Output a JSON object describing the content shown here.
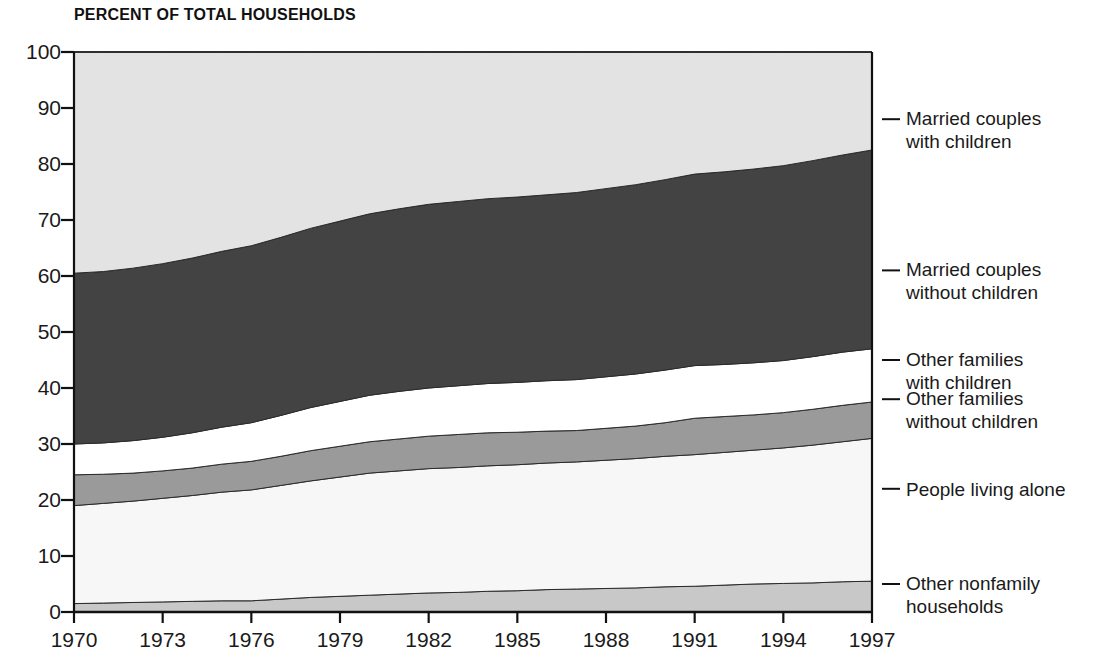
{
  "chart_data": {
    "type": "area",
    "title": "PERCENT OF TOTAL HOUSEHOLDS",
    "xlabel": "",
    "ylabel": "",
    "stacked": true,
    "stack_total": 100,
    "grid": false,
    "legend_position": "right-outside",
    "xlim": [
      1970,
      1997
    ],
    "ylim": [
      0,
      100
    ],
    "ytick_labels": [
      "0",
      "10",
      "20",
      "30",
      "40",
      "50",
      "60",
      "70",
      "80",
      "90",
      "100"
    ],
    "ytick_values": [
      0,
      10,
      20,
      30,
      40,
      50,
      60,
      70,
      80,
      90,
      100
    ],
    "xtick_labels": [
      "1970",
      "1973",
      "1976",
      "1979",
      "1982",
      "1985",
      "1988",
      "1991",
      "1994",
      "1997"
    ],
    "xtick_values": [
      1970,
      1973,
      1976,
      1979,
      1982,
      1985,
      1988,
      1991,
      1994,
      1997
    ],
    "x": [
      1970,
      1971,
      1972,
      1973,
      1974,
      1975,
      1976,
      1977,
      1978,
      1979,
      1980,
      1981,
      1982,
      1983,
      1984,
      1985,
      1986,
      1987,
      1988,
      1989,
      1990,
      1991,
      1992,
      1993,
      1994,
      1995,
      1996,
      1997
    ],
    "series": [
      {
        "name": "Other nonfamily households",
        "color": "#c8c8c8",
        "stack_order": 1,
        "values": [
          1.5,
          1.6,
          1.7,
          1.8,
          1.9,
          2.0,
          2.0,
          2.3,
          2.6,
          2.8,
          3.0,
          3.2,
          3.4,
          3.5,
          3.7,
          3.8,
          4.0,
          4.1,
          4.2,
          4.3,
          4.5,
          4.6,
          4.8,
          5.0,
          5.1,
          5.2,
          5.4,
          5.5
        ]
      },
      {
        "name": "People living alone",
        "color": "#f7f7f7",
        "stack_order": 2,
        "values": [
          17.5,
          17.8,
          18.1,
          18.5,
          18.9,
          19.4,
          19.8,
          20.3,
          20.8,
          21.3,
          21.8,
          22.0,
          22.2,
          22.3,
          22.4,
          22.5,
          22.6,
          22.7,
          22.9,
          23.1,
          23.3,
          23.5,
          23.7,
          23.9,
          24.2,
          24.6,
          25.0,
          25.5
        ]
      },
      {
        "name": "Other families without children",
        "color": "#9a9a9a",
        "stack_order": 3,
        "values": [
          5.5,
          5.2,
          5.0,
          4.9,
          4.9,
          5.0,
          5.1,
          5.2,
          5.4,
          5.5,
          5.6,
          5.7,
          5.8,
          5.9,
          5.9,
          5.8,
          5.7,
          5.6,
          5.7,
          5.8,
          6.0,
          6.5,
          6.4,
          6.3,
          6.3,
          6.4,
          6.5,
          6.5
        ]
      },
      {
        "name": "Other families with children",
        "color": "#ffffff",
        "stack_order": 4,
        "values": [
          5.5,
          5.6,
          5.8,
          6.0,
          6.3,
          6.6,
          6.9,
          7.3,
          7.7,
          8.0,
          8.3,
          8.5,
          8.6,
          8.7,
          8.8,
          8.9,
          9.0,
          9.1,
          9.2,
          9.3,
          9.4,
          9.4,
          9.3,
          9.3,
          9.3,
          9.4,
          9.5,
          9.5
        ]
      },
      {
        "name": "Married couples without children",
        "color": "#434343",
        "stack_order": 5,
        "values": [
          30.5,
          30.6,
          30.8,
          31.0,
          31.2,
          31.4,
          31.6,
          31.8,
          32.0,
          32.2,
          32.4,
          32.6,
          32.8,
          32.9,
          33.0,
          33.1,
          33.2,
          33.4,
          33.6,
          33.8,
          34.0,
          34.2,
          34.4,
          34.6,
          34.8,
          35.0,
          35.2,
          35.5
        ]
      },
      {
        "name": "Married couples with children",
        "color": "#e3e3e3",
        "stack_order": 6,
        "values": [
          39.5,
          39.2,
          38.6,
          37.8,
          36.8,
          35.6,
          34.6,
          33.1,
          31.5,
          30.2,
          28.9,
          28.0,
          27.2,
          26.7,
          26.2,
          25.9,
          25.5,
          25.1,
          24.4,
          23.7,
          22.8,
          21.8,
          21.4,
          20.9,
          20.3,
          19.4,
          18.4,
          17.5
        ]
      }
    ],
    "boundaries_note": "cumulative stacked tops, bottom-up",
    "legend_entries": [
      {
        "label": "Married couples\nwith children",
        "anchor_percent": 88
      },
      {
        "label": "Married couples\nwithout children",
        "anchor_percent": 61
      },
      {
        "label": "Other families\nwith children",
        "anchor_percent": 45
      },
      {
        "label": "Other families\nwithout children",
        "anchor_percent": 38
      },
      {
        "label": "People living alone",
        "anchor_percent": 22
      },
      {
        "label": "Other nonfamily\nhouseholds",
        "anchor_percent": 5
      }
    ]
  }
}
